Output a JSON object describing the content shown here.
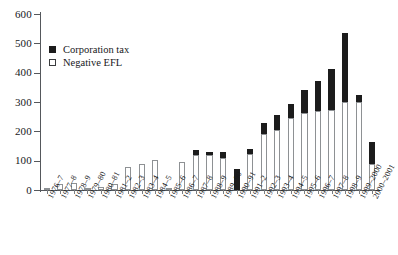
{
  "chart_data": {
    "type": "bar",
    "stacked": true,
    "title": "",
    "subtitle": "",
    "xlabel": "",
    "ylabel": "",
    "ylim": [
      0,
      600
    ],
    "ytick_step": 100,
    "ytick_labels": [
      "0",
      "100",
      "200",
      "300",
      "400",
      "500",
      "600"
    ],
    "grid": false,
    "legend_position": "top-left",
    "categories": [
      "1976–7",
      "1977–8",
      "1978–9",
      "1979–80",
      "1980–81",
      "1981–2",
      "1982–3",
      "1983–4",
      "1984–5",
      "1985–6",
      "1986–7",
      "1987–8",
      "1988–9",
      "1989–90",
      "1990–91",
      "1991–2",
      "1992–3",
      "1993–4",
      "1994–5",
      "1995–6",
      "1996–7",
      "1997–8",
      "1998–9",
      "1999–2000",
      "2000–2001"
    ],
    "series": [
      {
        "name": "Negative EFL",
        "color": "#ffffff",
        "edge_color": "#8e9194",
        "values": [
          3,
          22,
          25,
          6,
          10,
          22,
          78,
          88,
          103,
          2,
          95,
          118,
          120,
          108,
          0,
          122,
          190,
          205,
          244,
          262,
          268,
          272,
          300,
          300,
          88
        ]
      },
      {
        "name": "Corporation tax",
        "color": "#1c1c1c",
        "edge_color": "#1c1c1c",
        "values": [
          0,
          0,
          0,
          0,
          0,
          0,
          0,
          0,
          0,
          0,
          0,
          20,
          8,
          20,
          72,
          18,
          40,
          52,
          48,
          78,
          104,
          140,
          235,
          25,
          76
        ]
      }
    ],
    "totals": [
      3,
      22,
      25,
      6,
      10,
      22,
      78,
      88,
      103,
      2,
      95,
      138,
      128,
      128,
      72,
      140,
      230,
      257,
      292,
      340,
      372,
      412,
      535,
      325,
      164
    ]
  },
  "legend": {
    "items": [
      {
        "label": "Corporation tax",
        "swatch": "filled-square-black"
      },
      {
        "label": "Negative EFL",
        "swatch": "open-square-white"
      }
    ]
  }
}
